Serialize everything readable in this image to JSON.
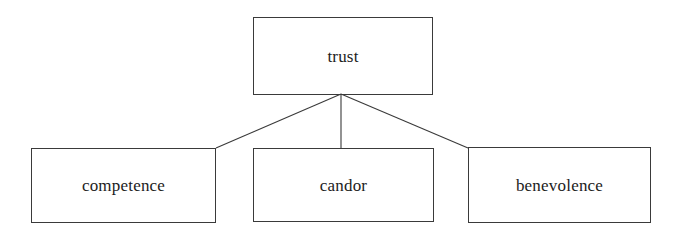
{
  "diagram": {
    "type": "hierarchy",
    "title": "trust",
    "background_color": "#ffffff",
    "stroke_color": "#3a3a3a",
    "text_color": "#1c1c1c",
    "root": {
      "id": "trust",
      "label": "trust"
    },
    "children": [
      {
        "id": "competence",
        "label": "competence"
      },
      {
        "id": "candor",
        "label": "candor"
      },
      {
        "id": "benevolence",
        "label": "benevolence"
      }
    ],
    "edges": [
      {
        "from": "trust",
        "to": "competence",
        "kind": "line"
      },
      {
        "from": "trust",
        "to": "candor",
        "kind": "line"
      },
      {
        "from": "trust",
        "to": "benevolence",
        "kind": "line"
      }
    ],
    "connector_hub": {
      "x": 341,
      "y": 94
    }
  }
}
